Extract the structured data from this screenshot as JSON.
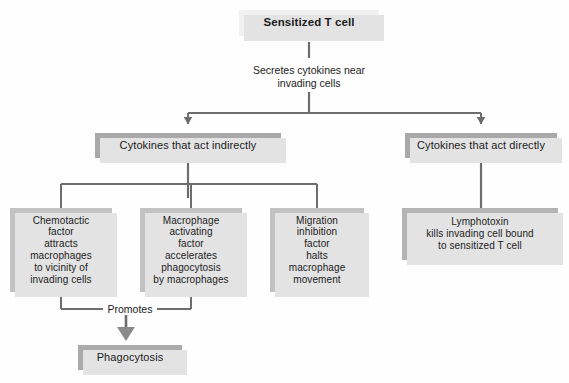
{
  "diagram": {
    "colors": {
      "background": "#fefefe",
      "top_box": "#f1f1f1",
      "level2_box": "#a9a9a9",
      "leaf_box": "#c2c2c2",
      "lymphotoxin_box": "#b4b4b4",
      "bottom_box": "#ababab",
      "shadow": "#e3e3e3",
      "line": "#6d6d6d",
      "text": "#1b1b1b"
    },
    "nodes": {
      "sensitized_t_cell": "Sensitized T cell",
      "secretes_caption": "Secretes cytokines near\ninvading cells",
      "cytokines_indirect": "Cytokines that act indirectly",
      "cytokines_direct": "Cytokines that act directly",
      "chemotactic_factor": "Chemotactic\nfactor\nattracts\nmacrophages\nto vicinity of\ninvading cells",
      "macrophage_activating_factor": "Macrophage\nactivating\nfactor\naccelerates\nphagocytosis\nby macrophages",
      "migration_inhibition_factor": "Migration\ninhibition\nfactor\nhalts\nmacrophage\nmovement",
      "lymphotoxin": "Lymphotoxin\nkills invading cell bound\nto sensitized T cell",
      "promotes": "Promotes",
      "phagocytosis": "Phagocytosis"
    }
  }
}
